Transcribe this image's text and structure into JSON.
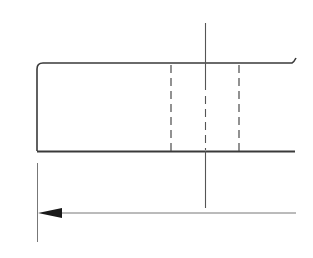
{
  "diagram": {
    "type": "technical-drawing",
    "colors": {
      "background": "#ffffff",
      "outline": "#3a3a3a",
      "hidden_line": "#4a4a4a",
      "center_line": "#555555",
      "dimension_line": "#777777",
      "arrowhead": "#1a1a1a"
    },
    "part_outline": {
      "left_x": 37,
      "top_y": 63,
      "bottom_y": 151,
      "right_x": 295,
      "top_left_corner": "rounded",
      "right_end": "break-line"
    },
    "hidden_lines": [
      {
        "x": 171,
        "y1": 64,
        "y2": 151,
        "style": "dashed"
      },
      {
        "x": 239,
        "y1": 64,
        "y2": 151,
        "style": "dashed"
      }
    ],
    "center_line": {
      "x": 205,
      "y1": 23,
      "y2": 208
    },
    "extension_line": {
      "x": 37,
      "y1": 163,
      "y2": 242
    },
    "dimension_line": {
      "y": 213,
      "x1": 37,
      "x2": 296,
      "arrow": "left"
    }
  }
}
